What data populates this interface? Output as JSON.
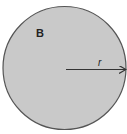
{
  "diagram": {
    "circle": {
      "label": "B",
      "fill": "#c9c9c9",
      "stroke": "#555555"
    },
    "radius": {
      "label": "r",
      "color": "#333333"
    }
  }
}
